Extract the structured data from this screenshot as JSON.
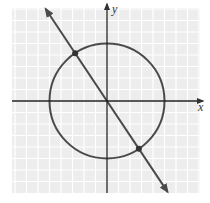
{
  "chart_data": {
    "type": "line",
    "title": "",
    "xlabel": "x",
    "ylabel": "y",
    "xlim": [
      -8.5,
      8.3
    ],
    "ylim": [
      -8,
      8.2
    ],
    "grid": true,
    "legend": null,
    "series": [
      {
        "name": "circle",
        "kind": "circle",
        "equation": "x^2 + y^2 = 25",
        "center": [
          0,
          0
        ],
        "radius": 5
      },
      {
        "name": "line",
        "kind": "line",
        "equation": "y = -1.5x",
        "slope": -1.5,
        "intercept": 0,
        "arrows": "both"
      }
    ],
    "points": [
      {
        "label": "intersection-1",
        "x": -2.77,
        "y": 4.16
      },
      {
        "label": "intersection-2",
        "x": 2.77,
        "y": -4.16
      }
    ]
  },
  "labels": {
    "x_axis": "x",
    "y_axis": "y"
  },
  "colors": {
    "grid_cell": "#ededed",
    "grid_line": "#ffffff",
    "curve": "#4a4a4a",
    "axis": "#222222"
  }
}
